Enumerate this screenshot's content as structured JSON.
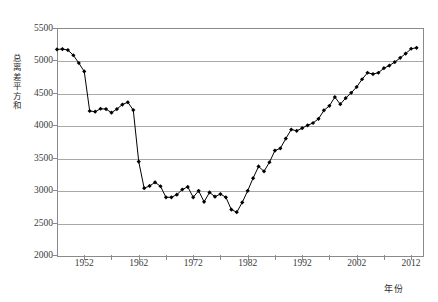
{
  "chart_data": {
    "type": "line",
    "title": "",
    "subtitle": "",
    "xlabel": "年份",
    "ylabel": "总离差平方和",
    "xlim": [
      1947,
      2014
    ],
    "ylim": [
      2000,
      5500
    ],
    "y_ticks": [
      2000,
      2500,
      3000,
      3500,
      4000,
      4500,
      5000,
      5500
    ],
    "x_ticks": [
      1952,
      1962,
      1972,
      1982,
      1992,
      2002,
      2012
    ],
    "x_tick_labels": [
      "1952",
      "1962",
      "1972",
      "1982",
      "1992",
      "2002",
      "2012"
    ],
    "y_tick_labels": [
      "2000",
      "2500",
      "3000",
      "3500",
      "4000",
      "4500",
      "5000",
      "5500"
    ],
    "x_minor_interval": 5,
    "grid": "horizontal",
    "legend": "none",
    "marker": "filled-diamond",
    "marker_color": "#000000",
    "line_color": "#000000",
    "frame_color": "#8a8a8a",
    "gridline_color": "#a8a8a8",
    "series": [
      {
        "name": "总离差平方和",
        "x": [
          1947,
          1948,
          1949,
          1950,
          1951,
          1952,
          1953,
          1954,
          1955,
          1956,
          1957,
          1958,
          1959,
          1960,
          1961,
          1962,
          1963,
          1964,
          1965,
          1966,
          1967,
          1968,
          1969,
          1970,
          1971,
          1972,
          1973,
          1974,
          1975,
          1976,
          1977,
          1978,
          1979,
          1980,
          1981,
          1982,
          1983,
          1984,
          1985,
          1986,
          1987,
          1988,
          1989,
          1990,
          1991,
          1992,
          1993,
          1994,
          1995,
          1996,
          1997,
          1998,
          1999,
          2000,
          2001,
          2002,
          2003,
          2004,
          2005,
          2006,
          2007,
          2008,
          2009,
          2010,
          2011,
          2012,
          2013
        ],
        "values": [
          5170,
          5175,
          5160,
          5080,
          4960,
          4830,
          4220,
          4210,
          4255,
          4250,
          4195,
          4250,
          4320,
          4355,
          4235,
          3440,
          3030,
          3065,
          3120,
          3060,
          2890,
          2890,
          2930,
          3010,
          3050,
          2890,
          2990,
          2820,
          2965,
          2900,
          2940,
          2890,
          2700,
          2660,
          2810,
          2990,
          3185,
          3365,
          3290,
          3430,
          3610,
          3645,
          3795,
          3935,
          3915,
          3955,
          4000,
          4035,
          4100,
          4230,
          4300,
          4435,
          4325,
          4420,
          4500,
          4590,
          4710,
          4810,
          4790,
          4810,
          4880,
          4920,
          4975,
          5040,
          5105,
          5180,
          5195
        ]
      }
    ]
  }
}
